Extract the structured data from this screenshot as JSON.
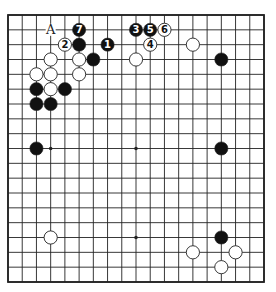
{
  "diagram": {
    "type": "go-board",
    "size": 19,
    "colors": {
      "background": "#ffffff",
      "line": "#222222",
      "black_stone": "#111111",
      "white_stone": "#ffffff",
      "stone_outline": "#222222"
    },
    "hoshi": [
      [
        3,
        3
      ],
      [
        9,
        3
      ],
      [
        15,
        3
      ],
      [
        3,
        9
      ],
      [
        9,
        9
      ],
      [
        15,
        9
      ],
      [
        3,
        15
      ],
      [
        9,
        15
      ],
      [
        15,
        15
      ]
    ],
    "stones": [
      {
        "color": "black",
        "col": 7,
        "row": 2,
        "label": "1"
      },
      {
        "color": "white",
        "col": 4,
        "row": 2,
        "label": "2"
      },
      {
        "color": "black",
        "col": 9,
        "row": 1,
        "label": "3"
      },
      {
        "color": "white",
        "col": 10,
        "row": 2,
        "label": "4"
      },
      {
        "color": "black",
        "col": 10,
        "row": 1,
        "label": "5"
      },
      {
        "color": "white",
        "col": 11,
        "row": 1,
        "label": "6"
      },
      {
        "color": "black",
        "col": 5,
        "row": 1,
        "label": "7"
      },
      {
        "color": "black",
        "col": 5,
        "row": 2,
        "label": ""
      },
      {
        "color": "black",
        "col": 6,
        "row": 3,
        "label": ""
      },
      {
        "color": "black",
        "col": 2,
        "row": 5,
        "label": ""
      },
      {
        "color": "black",
        "col": 4,
        "row": 5,
        "label": ""
      },
      {
        "color": "black",
        "col": 2,
        "row": 6,
        "label": ""
      },
      {
        "color": "black",
        "col": 3,
        "row": 6,
        "label": ""
      },
      {
        "color": "black",
        "col": 2,
        "row": 9,
        "label": ""
      },
      {
        "color": "black",
        "col": 15,
        "row": 9,
        "label": ""
      },
      {
        "color": "black",
        "col": 15,
        "row": 3,
        "label": ""
      },
      {
        "color": "black",
        "col": 15,
        "row": 15,
        "label": ""
      },
      {
        "color": "white",
        "col": 3,
        "row": 3,
        "label": ""
      },
      {
        "color": "white",
        "col": 5,
        "row": 3,
        "label": ""
      },
      {
        "color": "white",
        "col": 2,
        "row": 4,
        "label": ""
      },
      {
        "color": "white",
        "col": 3,
        "row": 4,
        "label": ""
      },
      {
        "color": "white",
        "col": 5,
        "row": 4,
        "label": ""
      },
      {
        "color": "white",
        "col": 3,
        "row": 5,
        "label": ""
      },
      {
        "color": "white",
        "col": 9,
        "row": 3,
        "label": ""
      },
      {
        "color": "white",
        "col": 13,
        "row": 2,
        "label": ""
      },
      {
        "color": "white",
        "col": 3,
        "row": 15,
        "label": ""
      },
      {
        "color": "white",
        "col": 13,
        "row": 16,
        "label": ""
      },
      {
        "color": "white",
        "col": 16,
        "row": 16,
        "label": ""
      },
      {
        "color": "white",
        "col": 15,
        "row": 17,
        "label": ""
      }
    ],
    "marks": [
      {
        "col": 3,
        "row": 1,
        "label": "A"
      }
    ]
  }
}
